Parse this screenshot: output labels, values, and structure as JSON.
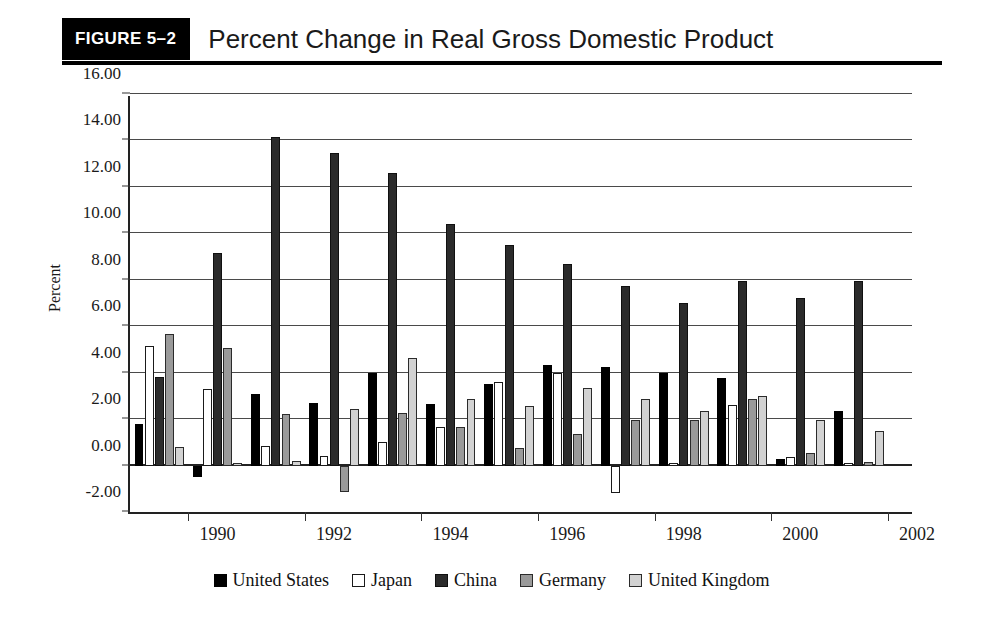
{
  "figure": {
    "badge": "FIGURE 5–2",
    "title": "Percent Change in Real Gross Domestic Product"
  },
  "chart_data": {
    "type": "bar",
    "title": "Percent Change in Real Gross Domestic Product",
    "xlabel": "",
    "ylabel": "Percent",
    "ylim": [
      -2.0,
      16.0
    ],
    "ytick_step": 2.0,
    "ytick_labels": [
      "16.00",
      "14.00",
      "12.00",
      "10.00",
      "8.00",
      "6.00",
      "4.00",
      "2.00",
      "0.00",
      "-2.00"
    ],
    "ytick_values": [
      16,
      14,
      12,
      10,
      8,
      6,
      4,
      2,
      0,
      -2
    ],
    "grid": true,
    "legend_position": "bottom",
    "categories": [
      1989,
      1990,
      1991,
      1992,
      1993,
      1994,
      1995,
      1996,
      1997,
      1998,
      1999,
      2000,
      2001
    ],
    "xtick_labels": [
      "1990",
      "1992",
      "1994",
      "1996",
      "1998",
      "2000",
      "2002"
    ],
    "xtick_values": [
      1990,
      1992,
      1994,
      1996,
      1998,
      2000,
      2002
    ],
    "series": [
      {
        "name": "United States",
        "color": "#000000",
        "values": [
          1.8,
          -0.5,
          3.1,
          2.7,
          4.0,
          2.65,
          3.5,
          4.35,
          4.25,
          4.0,
          3.75,
          0.3,
          2.35
        ]
      },
      {
        "name": "Japan",
        "color": "#ffffff",
        "values": [
          5.15,
          3.3,
          0.85,
          0.4,
          1.0,
          1.65,
          3.6,
          4.0,
          -1.2,
          0.1,
          2.6,
          0.35,
          0.1
        ]
      },
      {
        "name": "China",
        "color": "#2b2b2b",
        "values": [
          3.8,
          9.15,
          14.15,
          13.45,
          12.6,
          10.4,
          9.5,
          8.7,
          7.75,
          7.0,
          7.95,
          7.2,
          7.95
        ]
      },
      {
        "name": "Germany",
        "color": "#9a9a9a",
        "values": [
          5.65,
          5.05,
          2.2,
          -1.15,
          2.25,
          1.65,
          0.75,
          1.35,
          1.95,
          1.95,
          2.85,
          0.55,
          0.15
        ]
      },
      {
        "name": "United Kingdom",
        "color": "#d2d2d2",
        "values": [
          0.8,
          0.1,
          0.2,
          2.45,
          4.65,
          2.85,
          2.55,
          3.35,
          2.85,
          2.35,
          3.0,
          1.95,
          1.5
        ]
      }
    ]
  },
  "legend": {
    "items": [
      {
        "label": "United States",
        "swatch": "us"
      },
      {
        "label": "Japan",
        "swatch": "japan"
      },
      {
        "label": "China",
        "swatch": "china"
      },
      {
        "label": "Germany",
        "swatch": "germany"
      },
      {
        "label": "United Kingdom",
        "swatch": "uk"
      }
    ]
  }
}
